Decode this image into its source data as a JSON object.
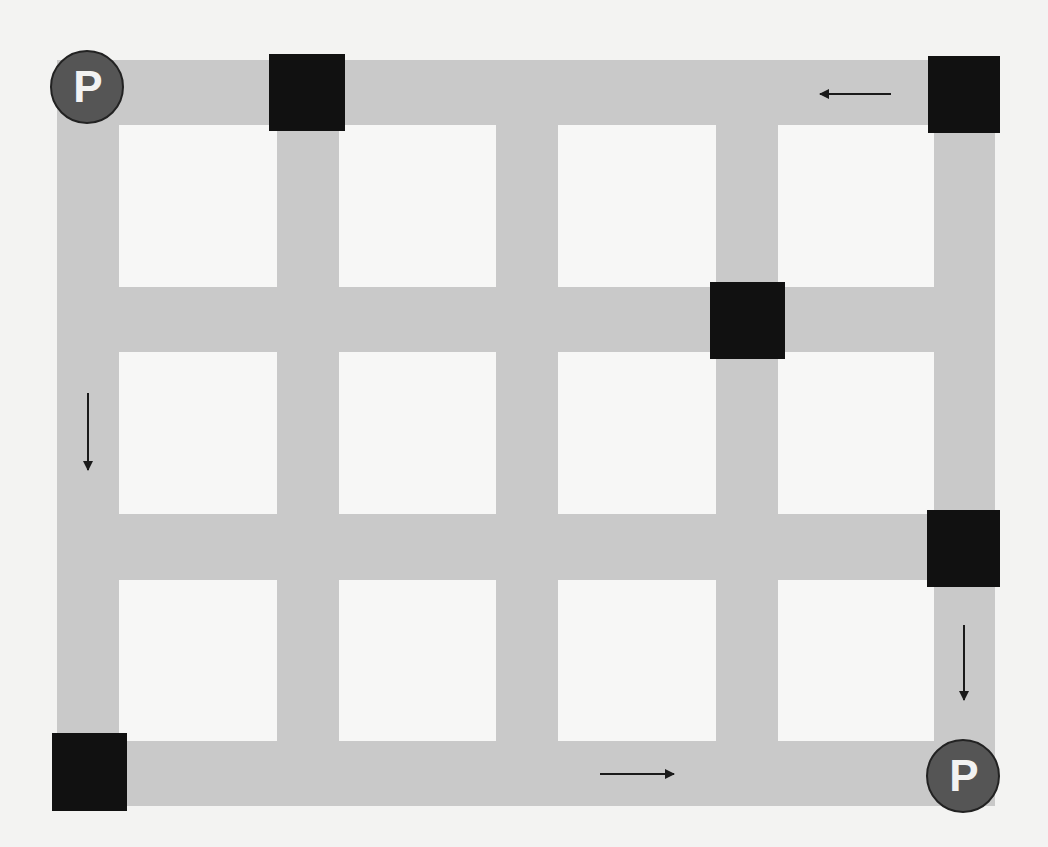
{
  "diagram": {
    "title": "",
    "type": "street-grid-map",
    "colors": {
      "background": "#f3f3f2",
      "road": "#c9c9c9",
      "block": "#f7f7f6",
      "obstacle": "#111111",
      "parking_fill": "#555555",
      "parking_stroke": "#222222",
      "parking_text": "#f2f2f2",
      "arrow": "#1a1a1a"
    },
    "grid": {
      "columns": 4,
      "rows": 3,
      "vertical_roads_x": [
        [
          57,
          119
        ],
        [
          277,
          339
        ],
        [
          496,
          558
        ],
        [
          716,
          778
        ],
        [
          934,
          995
        ]
      ],
      "horizontal_roads_y": [
        [
          60,
          125
        ],
        [
          287,
          352
        ],
        [
          514,
          580
        ],
        [
          741,
          806
        ]
      ]
    },
    "parking": [
      {
        "label": "P",
        "cx": 87,
        "cy": 87,
        "r": 36
      },
      {
        "label": "P",
        "cx": 963,
        "cy": 776,
        "r": 36
      }
    ],
    "obstacles": [
      {
        "x": 269,
        "y": 54,
        "w": 76,
        "h": 77
      },
      {
        "x": 928,
        "y": 56,
        "w": 72,
        "h": 77
      },
      {
        "x": 710,
        "y": 282,
        "w": 75,
        "h": 77
      },
      {
        "x": 927,
        "y": 510,
        "w": 73,
        "h": 77
      },
      {
        "x": 52,
        "y": 733,
        "w": 75,
        "h": 78
      }
    ],
    "arrows": [
      {
        "direction": "left",
        "x1": 891,
        "y1": 94,
        "x2": 820,
        "y2": 94
      },
      {
        "direction": "down",
        "x1": 88,
        "y1": 393,
        "x2": 88,
        "y2": 470
      },
      {
        "direction": "down",
        "x1": 964,
        "y1": 625,
        "x2": 964,
        "y2": 700
      },
      {
        "direction": "right",
        "x1": 600,
        "y1": 774,
        "x2": 674,
        "y2": 774
      }
    ]
  }
}
